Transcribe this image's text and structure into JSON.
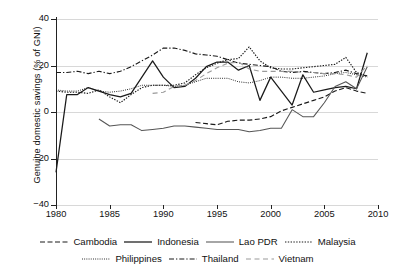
{
  "chart_data": {
    "type": "line",
    "title": "",
    "xlabel": "",
    "ylabel": "Genuine domestic savings (% of GNI)",
    "xlim": [
      1980,
      2010
    ],
    "ylim": [
      -40,
      40
    ],
    "xticks": [
      "1980",
      "1985",
      "1990",
      "1995",
      "2000",
      "2005",
      "2010"
    ],
    "yticks": [
      "40",
      "20",
      "0",
      "-20",
      "-40"
    ],
    "grid": "horizontal",
    "legend_position": "below",
    "series": [
      {
        "name": "Cambodia",
        "style": "dashed",
        "x": [
          1993,
          1994,
          1995,
          1996,
          1997,
          1998,
          1999,
          2000,
          2001,
          2002,
          2003,
          2004,
          2005,
          2006,
          2007,
          2008,
          2009
        ],
        "values": [
          -4.5,
          -5.0,
          -5.5,
          -4.0,
          -3.5,
          -3.5,
          -3.0,
          -2.0,
          0.5,
          2.0,
          3.5,
          5.0,
          6.5,
          9.0,
          10.5,
          9.0,
          8.0
        ]
      },
      {
        "name": "Indonesia",
        "style": "solid",
        "x": [
          1980,
          1981,
          1982,
          1983,
          1984,
          1985,
          1986,
          1987,
          1988,
          1989,
          1990,
          1991,
          1992,
          1993,
          1994,
          1995,
          1996,
          1997,
          1998,
          1999,
          2000,
          2001,
          2002,
          2003,
          2004,
          2005,
          2006,
          2007,
          2008,
          2009
        ],
        "values": [
          -26.0,
          7.5,
          7.5,
          10.5,
          9.0,
          7.5,
          6.5,
          8.0,
          15.0,
          22.0,
          15.0,
          10.5,
          11.0,
          14.5,
          19.5,
          21.5,
          21.5,
          18.0,
          20.0,
          5.0,
          15.0,
          9.0,
          3.0,
          16.0,
          8.5,
          9.5,
          10.5,
          11.0,
          10.0,
          25.5
        ]
      },
      {
        "name": "Lao PDR",
        "style": "solid-grey",
        "x": [
          1984,
          1985,
          1986,
          1987,
          1988,
          1989,
          1990,
          1991,
          1992,
          1993,
          1994,
          1995,
          1996,
          1997,
          1998,
          1999,
          2000,
          2001,
          2002,
          2003,
          2004,
          2005,
          2006,
          2007,
          2008,
          2009
        ],
        "values": [
          -3.0,
          -6.0,
          -5.5,
          -5.5,
          -8.0,
          -7.5,
          -7.0,
          -6.0,
          -6.0,
          -6.5,
          -7.0,
          -7.5,
          -7.5,
          -7.5,
          -8.5,
          -8.0,
          -7.0,
          -7.0,
          1.0,
          -2.0,
          -2.0,
          4.0,
          11.0,
          13.0,
          10.0,
          19.5
        ]
      },
      {
        "name": "Malaysia",
        "style": "dotted",
        "x": [
          1980,
          1981,
          1982,
          1983,
          1984,
          1985,
          1986,
          1987,
          1988,
          1989,
          1990,
          1991,
          1992,
          1993,
          1994,
          1995,
          1996,
          1997,
          1998,
          1999,
          2000,
          2001,
          2002,
          2003,
          2004,
          2005,
          2006,
          2007,
          2008,
          2009
        ],
        "values": [
          9.0,
          8.5,
          8.5,
          8.0,
          9.5,
          6.5,
          4.0,
          7.5,
          10.5,
          11.5,
          11.5,
          11.5,
          12.5,
          16.0,
          19.0,
          21.0,
          22.5,
          23.0,
          28.0,
          22.0,
          19.0,
          18.5,
          18.5,
          19.0,
          19.5,
          20.0,
          20.5,
          23.5,
          17.0,
          15.5
        ]
      },
      {
        "name": "Philippines",
        "style": "fine-dotted",
        "x": [
          1980,
          1981,
          1982,
          1983,
          1984,
          1985,
          1986,
          1987,
          1988,
          1989,
          1990,
          1991,
          1992,
          1993,
          1994,
          1995,
          1996,
          1997,
          1998,
          1999,
          2000,
          2001,
          2002,
          2003,
          2004,
          2005,
          2006,
          2007,
          2008,
          2009
        ],
        "values": [
          9.5,
          9.0,
          9.0,
          10.5,
          9.0,
          8.5,
          9.0,
          10.0,
          11.5,
          11.5,
          11.5,
          11.0,
          11.5,
          13.0,
          14.5,
          14.5,
          14.5,
          13.0,
          12.5,
          13.5,
          15.0,
          15.0,
          14.5,
          14.5,
          15.0,
          15.5,
          16.5,
          17.0,
          16.0,
          15.0
        ]
      },
      {
        "name": "Thailand",
        "style": "dash-dot",
        "x": [
          1980,
          1981,
          1982,
          1983,
          1984,
          1985,
          1986,
          1987,
          1988,
          1989,
          1990,
          1991,
          1992,
          1993,
          1994,
          1995,
          1996,
          1997,
          1998,
          1999,
          2000,
          2001,
          2002,
          2003,
          2004,
          2005,
          2006,
          2007,
          2008,
          2009
        ],
        "values": [
          17.0,
          17.0,
          17.5,
          16.5,
          17.5,
          16.5,
          17.5,
          19.5,
          22.0,
          24.5,
          27.5,
          27.5,
          26.5,
          25.0,
          24.5,
          24.0,
          22.5,
          21.0,
          20.5,
          20.0,
          19.5,
          17.5,
          17.0,
          17.5,
          17.0,
          16.5,
          17.0,
          18.0,
          16.5,
          15.5
        ]
      },
      {
        "name": "Vietnam",
        "style": "long-dash-light",
        "x": [
          1989,
          1990,
          1991,
          1992,
          1993,
          1994,
          1995,
          1996,
          1997,
          1998,
          1999,
          2000,
          2001,
          2002,
          2003,
          2004,
          2005,
          2006,
          2007,
          2008,
          2009
        ],
        "values": [
          8.0,
          8.5,
          11.0,
          11.5,
          13.5,
          16.5,
          19.0,
          21.0,
          21.5,
          18.5,
          17.5,
          17.5,
          17.5,
          17.5,
          17.0,
          17.0,
          16.5,
          16.5,
          16.0,
          15.0,
          20.0
        ]
      }
    ]
  },
  "legend": {
    "rows": [
      [
        {
          "label": "Cambodia",
          "style": "dashed"
        },
        {
          "label": "Indonesia",
          "style": "solid"
        },
        {
          "label": "Lao PDR",
          "style": "solid-grey"
        },
        {
          "label": "Malaysia",
          "style": "dotted"
        }
      ],
      [
        {
          "label": "Philippines",
          "style": "fine-dotted"
        },
        {
          "label": "Thailand",
          "style": "dash-dot"
        },
        {
          "label": "Vietnam",
          "style": "long-dash-light"
        }
      ]
    ]
  },
  "colors": {
    "axis": "#222222",
    "grid": "#d8d8d8",
    "line_dark": "#1a1a1a",
    "line_grey": "#555555",
    "line_light": "#9a9a9a",
    "background": "#ffffff"
  }
}
